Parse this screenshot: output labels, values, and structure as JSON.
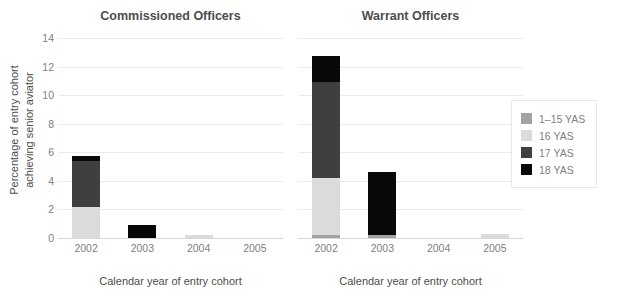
{
  "axes": {
    "ylabel_line1": "Percentage of entry cohort",
    "ylabel_line2": "achieving senior aviator",
    "xlabel": "Calendar year of entry cohort",
    "yticks": [
      "0",
      "2",
      "4",
      "6",
      "8",
      "10",
      "12",
      "14"
    ],
    "xticks": [
      "2002",
      "2003",
      "2004",
      "2005"
    ]
  },
  "panels": [
    {
      "title": "Commissioned Officers"
    },
    {
      "title": "Warrant Officers"
    }
  ],
  "legend": {
    "items": [
      {
        "label": "1–15 YAS",
        "color": "#a3a3a3",
        "icon": "legend-swatch-1-15-yas"
      },
      {
        "label": "16 YAS",
        "color": "#dbdbdb",
        "icon": "legend-swatch-16-yas"
      },
      {
        "label": "17 YAS",
        "color": "#3f3f3f",
        "icon": "legend-swatch-17-yas"
      },
      {
        "label": "18 YAS",
        "color": "#080808",
        "icon": "legend-swatch-18-yas"
      }
    ]
  },
  "chart_data": {
    "type": "bar",
    "subtype": "stacked",
    "title": "",
    "xlabel": "Calendar year of entry cohort",
    "ylabel": "Percentage of entry cohort achieving senior aviator",
    "ylim": [
      0,
      14
    ],
    "ytick_step": 2,
    "grid": true,
    "legend_position": "right",
    "categories": [
      "2002",
      "2003",
      "2004",
      "2005"
    ],
    "facets": [
      {
        "name": "Commissioned Officers",
        "series": [
          {
            "name": "1–15 YAS",
            "color": "#a3a3a3",
            "values": [
              0,
              0,
              0,
              0
            ]
          },
          {
            "name": "16 YAS",
            "color": "#dbdbdb",
            "values": [
              2.15,
              0,
              0.22,
              0
            ]
          },
          {
            "name": "17 YAS",
            "color": "#3f3f3f",
            "values": [
              3.25,
              0,
              0,
              0
            ]
          },
          {
            "name": "18 YAS",
            "color": "#080808",
            "values": [
              0.35,
              0.9,
              0,
              0
            ]
          }
        ],
        "totals": [
          5.75,
          0.9,
          0.22,
          0
        ]
      },
      {
        "name": "Warrant Officers",
        "series": [
          {
            "name": "1–15 YAS",
            "color": "#a3a3a3",
            "values": [
              0.2,
              0.2,
              0,
              0
            ]
          },
          {
            "name": "16 YAS",
            "color": "#dbdbdb",
            "values": [
              4.0,
              0,
              0,
              0.25
            ]
          },
          {
            "name": "17 YAS",
            "color": "#3f3f3f",
            "values": [
              6.75,
              0,
              0,
              0
            ]
          },
          {
            "name": "18 YAS",
            "color": "#080808",
            "values": [
              1.8,
              4.45,
              0,
              0
            ]
          }
        ],
        "totals": [
          12.75,
          4.65,
          0,
          0.25
        ]
      }
    ]
  }
}
